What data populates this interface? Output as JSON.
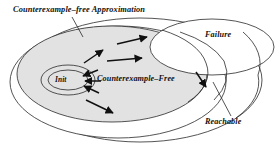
{
  "figure": {
    "width": 280,
    "height": 152,
    "background": "#ffffff",
    "stroke_color": "#1a1a1a",
    "fill_gray": "#e2e2e2",
    "fill_white": "#ffffff",
    "caption_style": "italic-serif-bold"
  },
  "labels": {
    "title": "Counterexample–free Approximation",
    "failure": "Failure",
    "reachable": "Reachable",
    "counterexample_free": "Counterexample–Free",
    "init": "Init"
  },
  "regions": [
    {
      "name": "counterexample-free-approximation",
      "label": "Counterexample–free Approximation",
      "shape": "ellipse",
      "cx": 118,
      "cy": 82,
      "rx": 108,
      "ry": 56,
      "fill": "#ffffff",
      "stroke": "#1a1a1a"
    },
    {
      "name": "counterexample-free",
      "label": "Counterexample–Free",
      "shape": "ellipse",
      "cx": 112,
      "cy": 74,
      "rx": 95,
      "ry": 48,
      "fill": "#e2e2e2",
      "stroke": "#1a1a1a"
    },
    {
      "name": "failure",
      "label": "Failure",
      "shape": "ellipse",
      "cx": 212,
      "cy": 47,
      "rx": 62,
      "ry": 28,
      "fill": "#ffffff",
      "stroke": "#1a1a1a"
    },
    {
      "name": "reachable",
      "label": "Reachable",
      "shape": "ellipse",
      "cx": 140,
      "cy": 80,
      "rx": 122,
      "ry": 62,
      "fill": "none",
      "stroke": "#1a1a1a"
    },
    {
      "name": "init",
      "label": "Init",
      "shape": "ellipse",
      "cx": 68,
      "cy": 80,
      "rx": 27,
      "ry": 15,
      "fill": "#e2e2e2",
      "stroke": "#1a1a1a"
    },
    {
      "name": "init-inner",
      "label": "Init",
      "shape": "ellipse",
      "cx": 68,
      "cy": 80,
      "rx": 20,
      "ry": 10,
      "fill": "#e2e2e2",
      "stroke": "#1a1a1a"
    }
  ],
  "arrows": [
    {
      "name": "arrow-init-upper",
      "x1": 97,
      "y1": 70,
      "x2": 82,
      "y2": 76
    },
    {
      "name": "arrow-init-lower",
      "x1": 99,
      "y1": 92,
      "x2": 83,
      "y2": 85
    },
    {
      "name": "arrow-init-mid",
      "x1": 100,
      "y1": 81,
      "x2": 84,
      "y2": 81
    },
    {
      "name": "arrow-lower-right",
      "x1": 86,
      "y1": 100,
      "x2": 112,
      "y2": 112
    },
    {
      "name": "arrow-mid-up",
      "x1": 84,
      "y1": 62,
      "x2": 103,
      "y2": 50
    },
    {
      "name": "arrow-to-failure-a",
      "x1": 108,
      "y1": 60,
      "x2": 142,
      "y2": 57
    },
    {
      "name": "arrow-to-failure-b",
      "x1": 118,
      "y1": 43,
      "x2": 146,
      "y2": 37
    },
    {
      "name": "arrow-into-reachable",
      "x1": 196,
      "y1": 72,
      "x2": 206,
      "y2": 86
    }
  ],
  "leader_lines": [
    {
      "name": "leader-title",
      "x1": 72,
      "y1": 16,
      "x2": 82,
      "y2": 36
    },
    {
      "name": "leader-reachable",
      "x1": 232,
      "y1": 116,
      "x2": 214,
      "y2": 82
    }
  ]
}
